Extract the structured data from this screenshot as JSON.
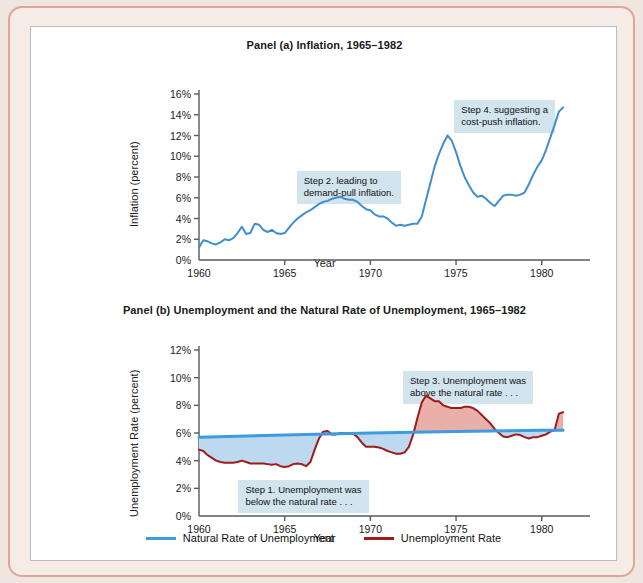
{
  "figure": {
    "panel_a_title": "Panel (a) Inflation, 1965–1982",
    "panel_b_title": "Panel (b) Unemployment and the Natural Rate of Unemployment, 1965–1982",
    "xlabel": "Year",
    "panel_a_ylabel": "Inflation (percent)",
    "panel_b_ylabel": "Unemployment Rate (percent)"
  },
  "colors": {
    "inflation_line": "#3f8fd0",
    "unemployment_line": "#9e1b1b",
    "natural_rate_line": "#3f9be0",
    "below_fill": "#bcd9ef",
    "above_fill": "#e8b0a8",
    "annotation_bg": "#d2e4ee",
    "axis": "#555a60",
    "frame_border": "#e0a49a",
    "frame_fill": "#f6ece6"
  },
  "annotations": {
    "step1": "Step 1. Unemployment was\nbelow the natural rate . . .",
    "step2": "Step 2. leading to\ndemand-pull inflation.",
    "step3": "Step 3. Unemployment was\nabove the natural rate . . .",
    "step4": "Step 4. suggesting a\ncost-push inflation."
  },
  "legend": [
    {
      "label": "Natural Rate of Unemployment",
      "color": "#3f9be0"
    },
    {
      "label": "Unemployment Rate",
      "color": "#9e1b1b"
    }
  ],
  "chart_data": [
    {
      "type": "line",
      "id": "panel_a",
      "title": "Panel (a) Inflation, 1965–1982",
      "xlabel": "Year",
      "ylabel": "Inflation (percent)",
      "xlim": [
        1960,
        1982
      ],
      "ylim": [
        0,
        16
      ],
      "yticks": [
        0,
        2,
        4,
        6,
        8,
        10,
        12,
        14,
        16
      ],
      "ytick_labels": [
        "0%",
        "2%",
        "4%",
        "6%",
        "8%",
        "10%",
        "12%",
        "14%",
        "16%"
      ],
      "xticks": [
        1960,
        1965,
        1970,
        1975,
        1980
      ],
      "xtick_labels": [
        "1960",
        "1965",
        "1970",
        "1975",
        "1980"
      ],
      "grid": false,
      "legend_position": "none",
      "series": [
        {
          "name": "Inflation",
          "color": "#3f8fd0",
          "x": [
            1960.0,
            1960.25,
            1960.5,
            1960.75,
            1961.0,
            1961.25,
            1961.5,
            1961.75,
            1962.0,
            1962.25,
            1962.5,
            1962.75,
            1963.0,
            1963.25,
            1963.5,
            1963.75,
            1964.0,
            1964.25,
            1964.5,
            1964.75,
            1965.0,
            1965.25,
            1965.5,
            1965.75,
            1966.0,
            1966.25,
            1966.5,
            1966.75,
            1967.0,
            1967.25,
            1967.5,
            1967.75,
            1968.0,
            1968.25,
            1968.5,
            1968.75,
            1969.0,
            1969.25,
            1969.5,
            1969.75,
            1970.0,
            1970.25,
            1970.5,
            1970.75,
            1971.0,
            1971.25,
            1971.5,
            1971.75,
            1972.0,
            1972.25,
            1972.5,
            1972.75,
            1973.0,
            1973.25,
            1973.5,
            1973.75,
            1974.0,
            1974.25,
            1974.5,
            1974.75,
            1975.0,
            1975.25,
            1975.5,
            1975.75,
            1976.0,
            1976.25,
            1976.5,
            1976.75,
            1977.0,
            1977.25,
            1977.5,
            1977.75,
            1978.0,
            1978.25,
            1978.5,
            1978.75,
            1979.0,
            1979.25,
            1979.5,
            1979.75,
            1980.0,
            1980.25,
            1980.5,
            1980.75,
            1981.0,
            1981.25
          ],
          "y": [
            1.2,
            1.9,
            1.8,
            1.6,
            1.5,
            1.7,
            2.0,
            1.9,
            2.1,
            2.6,
            3.2,
            2.5,
            2.6,
            3.5,
            3.4,
            2.9,
            2.7,
            2.9,
            2.6,
            2.5,
            2.6,
            3.1,
            3.6,
            4.0,
            4.3,
            4.6,
            4.8,
            5.1,
            5.4,
            5.6,
            5.7,
            5.9,
            6.0,
            6.1,
            5.9,
            5.8,
            5.8,
            5.6,
            5.2,
            4.9,
            4.8,
            4.4,
            4.2,
            4.2,
            4.0,
            3.6,
            3.3,
            3.4,
            3.3,
            3.4,
            3.5,
            3.5,
            4.2,
            5.8,
            7.4,
            9.0,
            10.2,
            11.2,
            12.0,
            11.5,
            10.4,
            9.1,
            8.0,
            7.2,
            6.5,
            6.1,
            6.2,
            5.9,
            5.5,
            5.2,
            5.7,
            6.2,
            6.3,
            6.3,
            6.2,
            6.3,
            6.5,
            7.3,
            8.2,
            9.0,
            9.6,
            10.6,
            11.8,
            13.0,
            14.3,
            14.7,
            13.8,
            12.8
          ]
        }
      ],
      "annotations": [
        {
          "text": "Step 2. leading to\ndemand-pull inflation.",
          "x": 1965.7,
          "y": 8.6
        },
        {
          "text": "Step 4. suggesting a\ncost-push inflation.",
          "x": 1974.9,
          "y": 15.4
        }
      ]
    },
    {
      "type": "line",
      "id": "panel_b",
      "title": "Panel (b) Unemployment and the Natural Rate of Unemployment, 1965–1982",
      "xlabel": "Year",
      "ylabel": "Unemployment Rate (percent)",
      "xlim": [
        1960,
        1982
      ],
      "ylim": [
        0,
        12
      ],
      "yticks": [
        0,
        2,
        4,
        6,
        8,
        10,
        12
      ],
      "ytick_labels": [
        "0%",
        "2%",
        "4%",
        "6%",
        "8%",
        "10%",
        "12%"
      ],
      "xticks": [
        1960,
        1965,
        1970,
        1975,
        1980
      ],
      "xtick_labels": [
        "1960",
        "1965",
        "1970",
        "1975",
        "1980"
      ],
      "grid": false,
      "legend_position": "bottom",
      "series": [
        {
          "name": "Unemployment Rate",
          "color": "#9e1b1b",
          "x": [
            1960.0,
            1960.25,
            1960.5,
            1960.75,
            1961.0,
            1961.25,
            1961.5,
            1961.75,
            1962.0,
            1962.25,
            1962.5,
            1962.75,
            1963.0,
            1963.25,
            1963.5,
            1963.75,
            1964.0,
            1964.25,
            1964.5,
            1964.75,
            1965.0,
            1965.25,
            1965.5,
            1965.75,
            1966.0,
            1966.25,
            1966.5,
            1966.75,
            1967.0,
            1967.25,
            1967.5,
            1967.75,
            1968.0,
            1968.25,
            1968.5,
            1968.75,
            1969.0,
            1969.25,
            1969.5,
            1969.75,
            1970.0,
            1970.25,
            1970.5,
            1970.75,
            1971.0,
            1971.25,
            1971.5,
            1971.75,
            1972.0,
            1972.25,
            1972.5,
            1972.75,
            1973.0,
            1973.25,
            1973.5,
            1973.75,
            1974.0,
            1974.25,
            1974.5,
            1974.75,
            1975.0,
            1975.25,
            1975.5,
            1975.75,
            1976.0,
            1976.25,
            1976.5,
            1976.75,
            1977.0,
            1977.25,
            1977.5,
            1977.75,
            1978.0,
            1978.25,
            1978.5,
            1978.75,
            1979.0,
            1979.25,
            1979.5,
            1979.75,
            1980.0,
            1980.25,
            1980.5,
            1980.75,
            1981.0,
            1981.25
          ],
          "y": [
            4.8,
            4.7,
            4.4,
            4.2,
            4.0,
            3.9,
            3.85,
            3.85,
            3.85,
            3.9,
            4.0,
            3.9,
            3.8,
            3.8,
            3.8,
            3.8,
            3.75,
            3.7,
            3.75,
            3.6,
            3.55,
            3.6,
            3.75,
            3.8,
            3.75,
            3.6,
            3.9,
            4.8,
            5.6,
            6.1,
            6.15,
            5.9,
            5.9,
            6.0,
            6.0,
            6.0,
            5.95,
            5.7,
            5.3,
            5.0,
            5.0,
            5.0,
            4.95,
            4.85,
            4.7,
            4.6,
            4.5,
            4.5,
            4.6,
            5.0,
            5.9,
            7.1,
            8.2,
            8.7,
            8.5,
            8.3,
            8.3,
            8.0,
            7.9,
            7.8,
            7.8,
            7.8,
            7.9,
            7.9,
            7.8,
            7.6,
            7.3,
            7.0,
            6.7,
            6.3,
            6.0,
            5.75,
            5.7,
            5.8,
            5.9,
            5.85,
            5.7,
            5.6,
            5.7,
            5.7,
            5.8,
            5.9,
            6.1,
            6.2,
            7.4,
            7.5
          ]
        },
        {
          "name": "Natural Rate of Unemployment",
          "color": "#3f9be0",
          "x": [
            1960,
            1965,
            1970,
            1975,
            1980,
            1981.25
          ],
          "y": [
            5.7,
            5.85,
            6.0,
            6.1,
            6.2,
            6.2
          ]
        }
      ],
      "annotations": [
        {
          "text": "Step 1. Unemployment was\nbelow the natural rate . . .",
          "x": 1962.3,
          "y": 2.6
        },
        {
          "text": "Step 3. Unemployment was\nabove the natural rate . . .",
          "x": 1971.9,
          "y": 10.5
        }
      ]
    }
  ]
}
